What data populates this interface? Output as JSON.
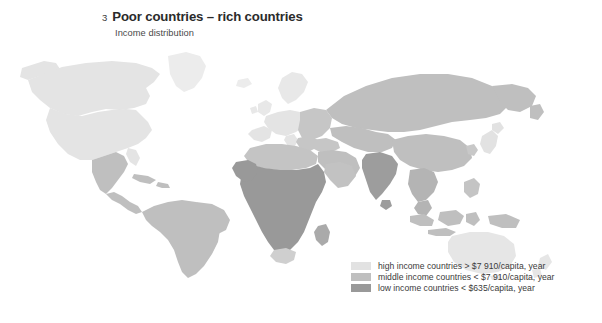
{
  "figure": {
    "number": "3",
    "title": "Poor countries – rich countries",
    "subtitle": "Income distribution"
  },
  "legend": {
    "items": [
      {
        "label": "high income countries > $7 910/capita, year",
        "color": "#e2e2e2",
        "tier": "high"
      },
      {
        "label": "middle income countries < $7 910/capita, year",
        "color": "#bfbfbf",
        "tier": "middle"
      },
      {
        "label": "low income countries < $635/capita, year",
        "color": "#999999",
        "tier": "low"
      }
    ]
  },
  "map": {
    "type": "choropleth",
    "background": "#ffffff",
    "colors": {
      "high": "#e2e2e2",
      "high_light": "#ececec",
      "middle": "#bfbfbf",
      "low": "#999999"
    },
    "regions": [
      {
        "name": "canada",
        "tier": "high"
      },
      {
        "name": "alaska",
        "tier": "high"
      },
      {
        "name": "greenland",
        "tier": "high"
      },
      {
        "name": "united-states",
        "tier": "high"
      },
      {
        "name": "mexico",
        "tier": "middle"
      },
      {
        "name": "central-america",
        "tier": "middle"
      },
      {
        "name": "caribbean",
        "tier": "middle"
      },
      {
        "name": "south-america",
        "tier": "middle"
      },
      {
        "name": "western-europe",
        "tier": "high"
      },
      {
        "name": "scandinavia",
        "tier": "high"
      },
      {
        "name": "british-isles",
        "tier": "high"
      },
      {
        "name": "eastern-europe",
        "tier": "middle"
      },
      {
        "name": "russia",
        "tier": "middle"
      },
      {
        "name": "north-africa",
        "tier": "middle"
      },
      {
        "name": "sub-saharan-africa",
        "tier": "low"
      },
      {
        "name": "south-africa",
        "tier": "middle"
      },
      {
        "name": "madagascar",
        "tier": "low"
      },
      {
        "name": "middle-east",
        "tier": "middle"
      },
      {
        "name": "india",
        "tier": "low"
      },
      {
        "name": "china",
        "tier": "middle"
      },
      {
        "name": "southeast-asia",
        "tier": "middle"
      },
      {
        "name": "indonesia",
        "tier": "middle"
      },
      {
        "name": "japan",
        "tier": "high"
      },
      {
        "name": "australia",
        "tier": "high"
      },
      {
        "name": "new-zealand",
        "tier": "high"
      }
    ]
  }
}
